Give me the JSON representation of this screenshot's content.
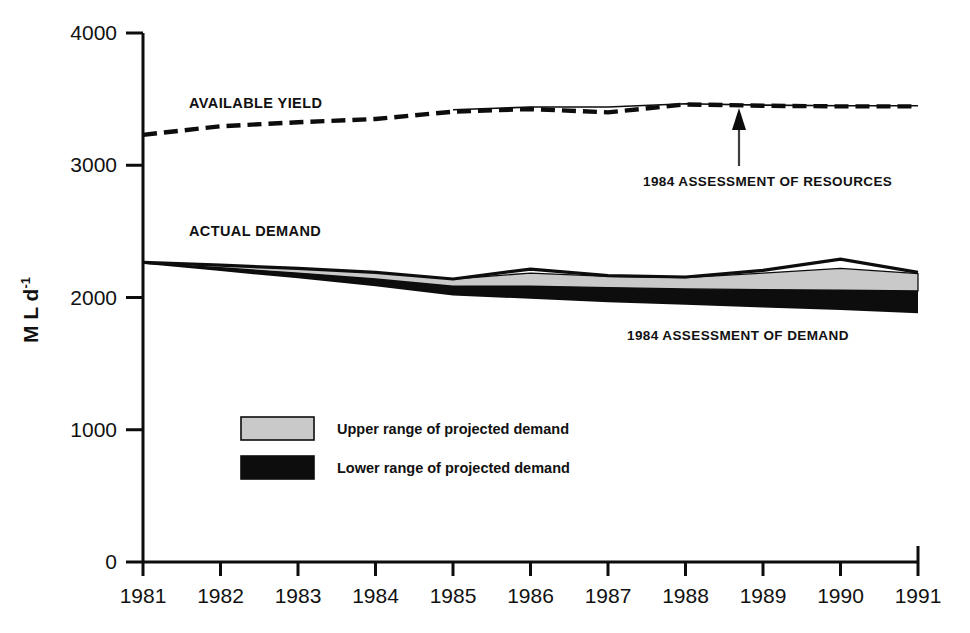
{
  "chart_data": {
    "type": "area",
    "title": "",
    "xlabel": "",
    "ylabel": "M L d⁻¹",
    "ylabel_base": "M L d",
    "ylabel_exponent": "-1",
    "xlim": [
      1981,
      1991
    ],
    "ylim": [
      0,
      4000
    ],
    "grid": false,
    "legend_position": "inside-lower-left",
    "x": [
      1981,
      1982,
      1983,
      1984,
      1985,
      1986,
      1987,
      1988,
      1989,
      1990,
      1991
    ],
    "y_ticks": [
      0,
      1000,
      2000,
      3000,
      4000
    ],
    "y_tick_labels": [
      "0",
      "1000",
      "2000",
      "3000",
      "4000"
    ],
    "x_ticks": [
      1981,
      1982,
      1983,
      1984,
      1985,
      1986,
      1987,
      1988,
      1989,
      1990,
      1991
    ],
    "x_tick_labels": [
      "1981",
      "1982",
      "1983",
      "1984",
      "1985",
      "1986",
      "1987",
      "1988",
      "1989",
      "1990",
      "1991"
    ],
    "series": [
      {
        "name": "Available yield",
        "label": "AVAILABLE YIELD",
        "style": "dashed",
        "color": "#0d0d0d",
        "values": [
          3230,
          3295,
          3325,
          3350,
          3405,
          3425,
          3400,
          3460,
          3450,
          3445,
          3445
        ]
      },
      {
        "name": "1984 assessment of resources",
        "label": "1984 ASSESSMENT OF RESOURCES",
        "style": "solid-thin",
        "color": "#0d0d0d",
        "values": [
          null,
          null,
          null,
          null,
          3420,
          3440,
          3440,
          3465,
          3455,
          3450,
          3450
        ]
      },
      {
        "name": "Actual demand",
        "label": "ACTUAL DEMAND",
        "style": "solid",
        "color": "#0d0d0d",
        "values": [
          2265,
          2245,
          2220,
          2190,
          2140,
          2215,
          2165,
          2155,
          2205,
          2290,
          2190
        ]
      },
      {
        "name": "Upper range of projected demand",
        "label": "Upper range of projected demand",
        "style": "band-light",
        "color": "#c9c9c9",
        "upper": [
          2265,
          2245,
          2220,
          2190,
          2140,
          2185,
          2160,
          2150,
          2185,
          2220,
          2180
        ],
        "lower": [
          2260,
          2225,
          2185,
          2140,
          2085,
          2085,
          2075,
          2065,
          2060,
          2055,
          2050
        ]
      },
      {
        "name": "Lower range of projected demand",
        "label": "Lower range of projected demand",
        "style": "band-dark",
        "color": "#0d0d0d",
        "upper": [
          2260,
          2225,
          2185,
          2140,
          2085,
          2085,
          2075,
          2065,
          2060,
          2055,
          2050
        ],
        "lower": [
          2255,
          2200,
          2145,
          2085,
          2015,
          1990,
          1965,
          1945,
          1925,
          1905,
          1880
        ]
      }
    ],
    "annotations": [
      {
        "id": "resources",
        "text": "1984 ASSESSMENT OF RESOURCES",
        "arrow": true,
        "arrow_from_year": 1988.7,
        "arrow_from_value": 2800,
        "arrow_to_value": 3370
      },
      {
        "id": "demand",
        "text": "1984 ASSESSMENT OF DEMAND",
        "arrow": false,
        "at_year": 1987.4,
        "at_value": 1690
      }
    ],
    "legend": [
      {
        "label": "Upper range of projected demand",
        "color": "#c9c9c9",
        "swatch": "light"
      },
      {
        "label": "Lower range of projected demand",
        "color": "#0d0d0d",
        "swatch": "dark"
      }
    ]
  },
  "colors": {
    "axis": "#0d0d0d",
    "text": "#111111",
    "upper_band": "#c9c9c9",
    "lower_band": "#0d0d0d",
    "background": "#ffffff"
  }
}
